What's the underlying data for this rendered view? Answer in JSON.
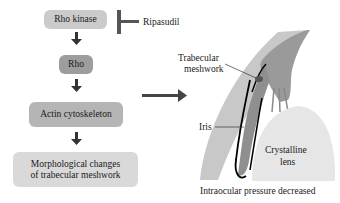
{
  "flowchart": {
    "boxes": [
      {
        "id": "rho-kinase",
        "label": "Rho kinase"
      },
      {
        "id": "rho",
        "label": "Rho"
      },
      {
        "id": "actin",
        "label": "Actin cytoskeleton"
      },
      {
        "id": "morph",
        "label_line1": "Morphological changes",
        "label_line2": "of trabecular meshwork"
      }
    ],
    "inhibitor": "Ripasudil"
  },
  "eye_illustration": {
    "labels": {
      "trabecular_line1": "Trabecular",
      "trabecular_line2": "meshwork",
      "iris": "Iris",
      "lens_line1": "Crystalline",
      "lens_line2": "lens"
    },
    "caption": "Intraocular pressure decreased"
  },
  "colors": {
    "box_light": "#cbcbcb",
    "box_dark": "#9d9d9d",
    "arrow": "#3a3a3a",
    "cornea": "#c8c8c8",
    "iris": "#8f8f8f",
    "lens": "#e6e6e6"
  }
}
